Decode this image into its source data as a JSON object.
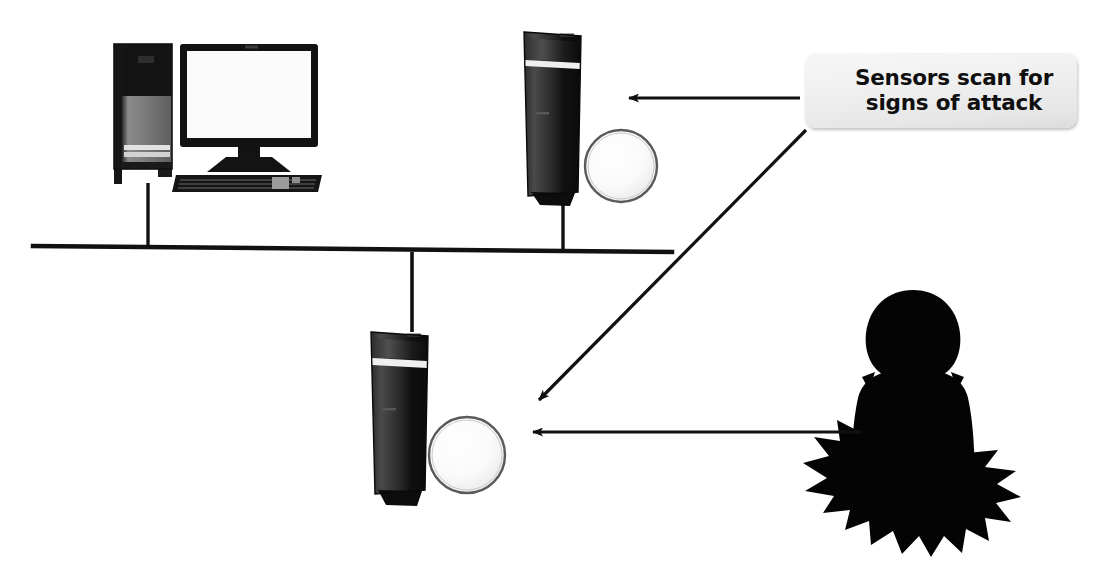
{
  "diagram": {
    "title": "Sensors scan for signs of attack",
    "background_color": "#ffffff",
    "callout": {
      "text": "Sensors scan for\nsigns of attack",
      "fill_color": "#eeeeee",
      "text_color": "#100f0f"
    },
    "nodes": [
      {
        "name": "workstation",
        "type": "desktop-computer",
        "label": "",
        "parts": [
          "pc-tower",
          "monitor",
          "keyboard"
        ],
        "tower_top_color": "#151515",
        "tower_body_color": "#6e6e6e",
        "monitor_bezel_color": "#121212",
        "monitor_screen_color": "#fbfbfb"
      },
      {
        "name": "sensor-upper",
        "type": "sensor-server",
        "label": "",
        "tower_color": "#121212",
        "sphere_color": "#fdfdfd",
        "sphere_outline_color": "#555555"
      },
      {
        "name": "sensor-lower",
        "type": "sensor-server",
        "label": "",
        "tower_color": "#121212",
        "sphere_color": "#fdfdfd",
        "sphere_outline_color": "#555555"
      },
      {
        "name": "attacker",
        "type": "person-silhouette-burst",
        "label": "",
        "color": "#040404"
      }
    ],
    "network_bus": {
      "name": "network-backbone",
      "color": "#111111",
      "stroke_width": 4
    },
    "arrows": [
      {
        "name": "callout-to-sensor-upper",
        "from": "callout",
        "to": "sensor-upper",
        "color": "#111111",
        "direction": "left"
      },
      {
        "name": "callout-to-sensor-lower",
        "from": "callout",
        "to": "sensor-lower",
        "color": "#111111",
        "direction": "down-left"
      },
      {
        "name": "attacker-to-sensor-lower",
        "from": "attacker",
        "to": "sensor-lower",
        "color": "#111111",
        "direction": "left"
      }
    ]
  }
}
